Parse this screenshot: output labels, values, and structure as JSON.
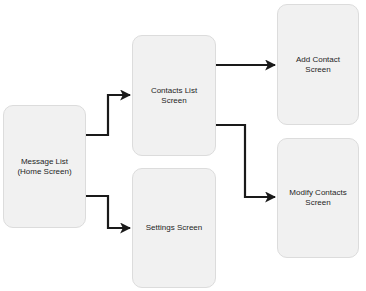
{
  "diagram": {
    "type": "flowchart",
    "colors": {
      "node_fill": "#f1f1f1",
      "node_border": "#dcdcdc",
      "edge": "#1a1a1a",
      "text": "#1e1e1e",
      "background": "#ffffff"
    },
    "nodes": {
      "home": {
        "label": "Message List\n(Home Screen)"
      },
      "contacts": {
        "label": "Contacts List\nScreen"
      },
      "settings": {
        "label": "Settings Screen"
      },
      "add": {
        "label": "Add Contact\nScreen"
      },
      "modify": {
        "label": "Modify Contacts\nScreen"
      }
    },
    "edges": [
      {
        "from": "home",
        "to": "contacts"
      },
      {
        "from": "home",
        "to": "settings"
      },
      {
        "from": "contacts",
        "to": "add"
      },
      {
        "from": "contacts",
        "to": "modify"
      }
    ]
  }
}
